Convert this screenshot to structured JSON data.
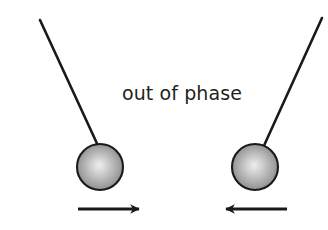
{
  "figure": {
    "title_text": "out of phase",
    "background_color": "#ffffff",
    "stroke_color": "#1a1a1a",
    "text_color": "#231f20",
    "bob_edge_color": "#6e6e6e",
    "bob_highlight_color": "#e8e8e8",
    "bob_outline_color": "#1a1a1a"
  },
  "pendulums": [
    {
      "id": "left-pendulum",
      "label": "left pendulum",
      "pivot_x": 40,
      "pivot_y": 20,
      "bob_cx": 100,
      "bob_cy": 167,
      "bob_r": 23,
      "direction": "right",
      "arrow_label": "velocity arrow pointing right",
      "arrow_x1": 78,
      "arrow_x2": 142,
      "arrow_y": 209
    },
    {
      "id": "right-pendulum",
      "label": "right pendulum",
      "pivot_x": 322,
      "pivot_y": 18,
      "bob_cx": 255,
      "bob_cy": 167,
      "bob_r": 23,
      "direction": "left",
      "arrow_label": "velocity arrow pointing left",
      "arrow_x1": 287,
      "arrow_x2": 222,
      "arrow_y": 209
    }
  ],
  "caption": {
    "text": "out of phase",
    "x": 182,
    "y": 100
  }
}
